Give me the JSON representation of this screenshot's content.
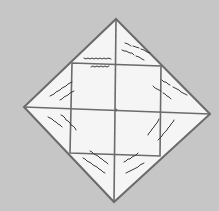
{
  "diagram": {
    "kind": "paper fortune teller (unfolded top view)",
    "colors": {
      "background": "#c6c6c6",
      "paper": "#f5f5f5",
      "fold_line": "#6b6b6b",
      "scribble": "#3a3a3a"
    },
    "outer_vertices": {
      "top": [
        116,
        19
      ],
      "right": [
        210,
        114
      ],
      "bottom": [
        114,
        202
      ],
      "left": [
        24,
        107
      ]
    },
    "center": [
      116,
      110
    ],
    "edge_midpoints": {
      "top_left": [
        72,
        63
      ],
      "top_right": [
        161,
        66
      ],
      "bottom_right": [
        160,
        156
      ],
      "bottom_left": [
        70,
        153
      ]
    },
    "flaps": [
      {
        "id": "top-left-upper",
        "label": "illegible handwritten note (2 lines)"
      },
      {
        "id": "top-right-upper",
        "label": "illegible handwritten note (2 lines)"
      },
      {
        "id": "right-upper",
        "label": "illegible handwritten note (2 lines)"
      },
      {
        "id": "right-lower",
        "label": "illegible handwritten note (2 lines)"
      },
      {
        "id": "bottom-right",
        "label": "illegible handwritten note (2 lines)"
      },
      {
        "id": "bottom-left",
        "label": "illegible handwritten note (2 lines)"
      },
      {
        "id": "left-lower",
        "label": "illegible handwritten note (2 lines)"
      },
      {
        "id": "left-upper",
        "label": "illegible handwritten note (2 lines)"
      }
    ]
  }
}
